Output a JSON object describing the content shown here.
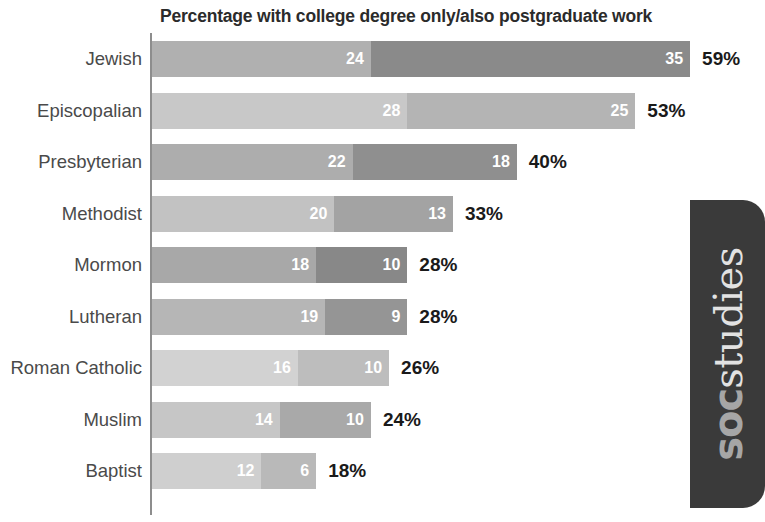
{
  "chart_data": {
    "type": "bar",
    "title": "Percentage with college degree only/also postgraduate work",
    "xlabel": "",
    "ylabel": "",
    "orientation": "horizontal",
    "stacked": true,
    "grid": false,
    "legend_position": "none",
    "xlim": [
      0,
      59
    ],
    "categories": [
      "Jewish",
      "Episcopalian",
      "Presbyterian",
      "Methodist",
      "Mormon",
      "Lutheran",
      "Roman Catholic",
      "Muslim",
      "Baptist"
    ],
    "series": [
      {
        "name": "college degree only",
        "values": [
          24,
          28,
          22,
          20,
          18,
          19,
          16,
          14,
          12
        ]
      },
      {
        "name": "also postgraduate work",
        "values": [
          35,
          25,
          18,
          13,
          10,
          9,
          10,
          10,
          6
        ]
      }
    ],
    "totals": [
      59,
      53,
      40,
      33,
      28,
      28,
      26,
      24,
      18
    ],
    "total_labels": [
      "59%",
      "53%",
      "40%",
      "33%",
      "28%",
      "28%",
      "26%",
      "24%",
      "18%"
    ],
    "rows": [
      {
        "category": "Jewish",
        "seg1_value": 24,
        "seg1_label": "24",
        "seg1_color": "#b0b0b0",
        "seg2_value": 35,
        "seg2_label": "35",
        "seg2_color": "#8a8a8a",
        "total": 59,
        "total_label": "59%"
      },
      {
        "category": "Episcopalian",
        "seg1_value": 28,
        "seg1_label": "28",
        "seg1_color": "#c8c8c8",
        "seg2_value": 25,
        "seg2_label": "25",
        "seg2_color": "#b4b4b4",
        "total": 53,
        "total_label": "53%"
      },
      {
        "category": "Presbyterian",
        "seg1_value": 22,
        "seg1_label": "22",
        "seg1_color": "#adadad",
        "seg2_value": 18,
        "seg2_label": "18",
        "seg2_color": "#8f8f8f",
        "total": 40,
        "total_label": "40%"
      },
      {
        "category": "Methodist",
        "seg1_value": 20,
        "seg1_label": "20",
        "seg1_color": "#c2c2c2",
        "seg2_value": 13,
        "seg2_label": "13",
        "seg2_color": "#a3a3a3",
        "total": 33,
        "total_label": "33%"
      },
      {
        "category": "Mormon",
        "seg1_value": 18,
        "seg1_label": "18",
        "seg1_color": "#a8a8a8",
        "seg2_value": 10,
        "seg2_label": "10",
        "seg2_color": "#888888",
        "total": 28,
        "total_label": "28%"
      },
      {
        "category": "Lutheran",
        "seg1_value": 19,
        "seg1_label": "19",
        "seg1_color": "#b6b6b6",
        "seg2_value": 9,
        "seg2_label": "9",
        "seg2_color": "#959595",
        "total": 28,
        "total_label": "28%"
      },
      {
        "category": "Roman Catholic",
        "seg1_value": 16,
        "seg1_label": "16",
        "seg1_color": "#d2d2d2",
        "seg2_value": 10,
        "seg2_label": "10",
        "seg2_color": "#bdbdbd",
        "total": 26,
        "total_label": "26%"
      },
      {
        "category": "Muslim",
        "seg1_value": 14,
        "seg1_label": "14",
        "seg1_color": "#c6c6c6",
        "seg2_value": 10,
        "seg2_label": "10",
        "seg2_color": "#a9a9a9",
        "total": 24,
        "total_label": "24%"
      },
      {
        "category": "Baptist",
        "seg1_value": 12,
        "seg1_label": "12",
        "seg1_color": "#cfcfcf",
        "seg2_value": 6,
        "seg2_label": "6",
        "seg2_color": "#b9b9b9",
        "total": 18,
        "total_label": "18%"
      }
    ]
  },
  "logo": {
    "part1": "soc",
    "part2": "studies",
    "background_color": "#3a3a3a"
  },
  "style": {
    "axis_color": "#8d8d8d",
    "title_color": "#2b2b2b",
    "label_color": "#4a4a4a",
    "total_color": "#1a1a1a",
    "value_color": "#ffffff"
  }
}
